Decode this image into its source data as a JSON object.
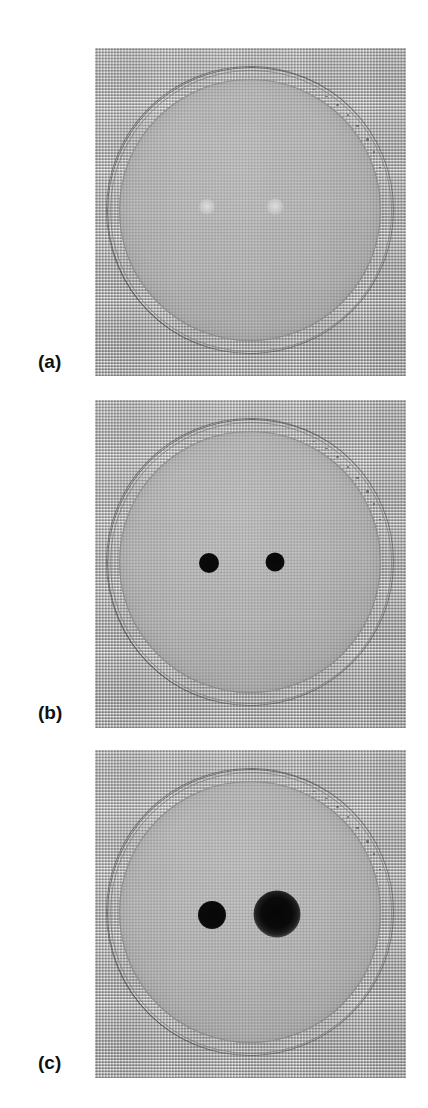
{
  "figure": {
    "kind": "photographic-figure",
    "background_color": "#ffffff",
    "width": 428,
    "height": 1108,
    "panel_count": 3
  },
  "colors": {
    "page_background": "#ffffff",
    "mesh_background": "#a6a6a6",
    "mesh_light_thread": "#e0e0e0",
    "mesh_dark_thread": "#7a7a7a",
    "dish_agar": "#b0b0b0",
    "dish_rim": "#5e5e5e",
    "colony_dark": "#0a0a0a",
    "colony_faint": "#dedede",
    "label_text": "#111111"
  },
  "panels": [
    {
      "id": "panel-a",
      "label": "(a)",
      "label_x": 38,
      "label_y": 352,
      "image": {
        "x": 95,
        "y": 48,
        "width": 311,
        "height": 328
      },
      "dish": {
        "cx": 250,
        "cy": 210,
        "diameter": 286
      },
      "spots": [
        {
          "name": "left-spot",
          "cx": 207,
          "cy": 207,
          "diameter": 16,
          "appearance": "faint"
        },
        {
          "name": "right-spot",
          "cx": 275,
          "cy": 207,
          "diameter": 17,
          "appearance": "faint"
        }
      ]
    },
    {
      "id": "panel-b",
      "label": "(b)",
      "label_x": 38,
      "label_y": 703,
      "image": {
        "x": 95,
        "y": 400,
        "width": 311,
        "height": 328
      },
      "dish": {
        "cx": 250,
        "cy": 562,
        "diameter": 286
      },
      "spots": [
        {
          "name": "left-spot",
          "cx": 209,
          "cy": 563,
          "diameter": 20,
          "appearance": "dark"
        },
        {
          "name": "right-spot",
          "cx": 275,
          "cy": 562,
          "diameter": 19,
          "appearance": "dark"
        }
      ]
    },
    {
      "id": "panel-c",
      "label": "(c)",
      "label_x": 38,
      "label_y": 1053,
      "image": {
        "x": 95,
        "y": 750,
        "width": 311,
        "height": 328
      },
      "dish": {
        "cx": 250,
        "cy": 912,
        "diameter": 286
      },
      "spots": [
        {
          "name": "left-spot",
          "cx": 212,
          "cy": 915,
          "diameter": 28,
          "appearance": "dark"
        },
        {
          "name": "right-spot",
          "cx": 277,
          "cy": 914,
          "diameter": 47,
          "appearance": "diffuse"
        }
      ]
    }
  ]
}
